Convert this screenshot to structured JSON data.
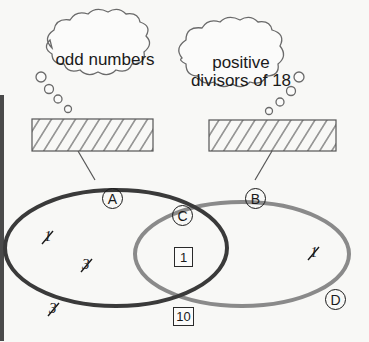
{
  "diagram": {
    "type": "venn",
    "clouds": {
      "left": {
        "text": "odd numbers"
      },
      "right": {
        "line1": "positive",
        "line2": "divisors of 18"
      }
    },
    "answer_boxes": [
      {
        "id": "left",
        "pattern": "hatched",
        "content": ""
      },
      {
        "id": "right",
        "pattern": "hatched",
        "content": ""
      }
    ],
    "region_labels": {
      "A": "A",
      "B": "B",
      "C": "C",
      "D": "D"
    },
    "items": {
      "left_only_1": "1",
      "left_only_2": "3",
      "outside_left": "3",
      "intersection_box": "1",
      "right_only": "1",
      "below_box": "10"
    },
    "colors": {
      "set_a_stroke": "#3a3a3a",
      "set_b_stroke": "#8a8a8a",
      "ink": "#1a1a1a",
      "background": "#f8f8f6"
    }
  }
}
